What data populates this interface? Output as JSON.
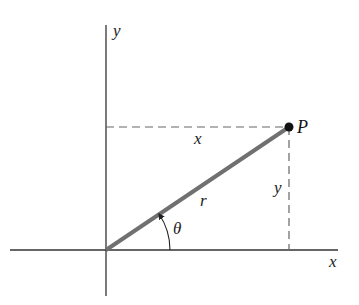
{
  "diagram": {
    "labels": {
      "y_axis": "y",
      "x_axis": "x",
      "point": "P",
      "horizontal_leg": "x",
      "vertical_leg": "y",
      "radius": "r",
      "angle": "θ"
    },
    "colors": {
      "axes": "#333333",
      "radius_line": "#707070",
      "dashed": "#666666",
      "point": "#111111"
    }
  }
}
